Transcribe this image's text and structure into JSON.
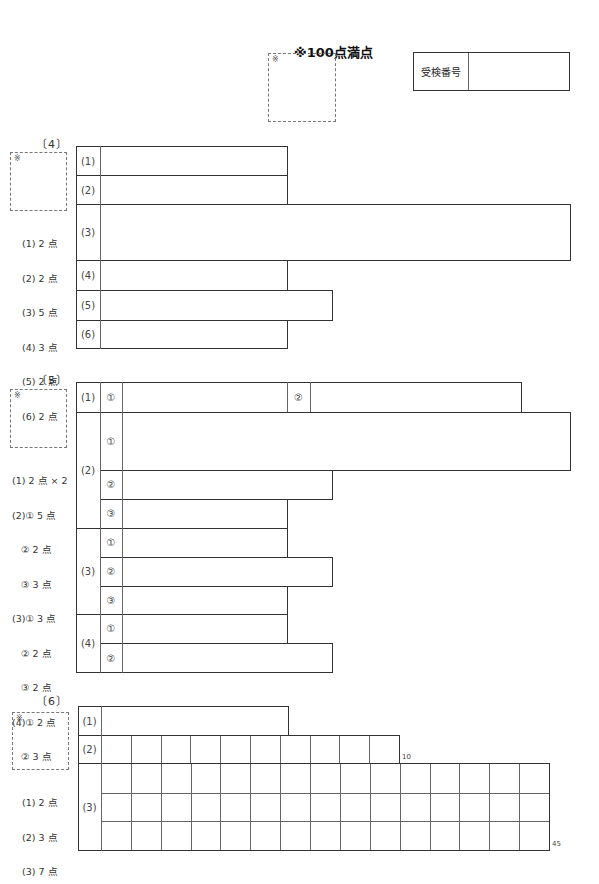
{
  "header": {
    "total_title": "※100点満点",
    "total_box_mark": "※",
    "exam_number_label": "受検番号",
    "exam_number_value": ""
  },
  "section4": {
    "label": "〔4〕",
    "box_mark": "※",
    "points": [
      "(1) 2 点",
      "(2) 2 点",
      "(3) 5 点",
      "(4) 3 点",
      "(5) 2 点",
      "(6) 2 点"
    ],
    "rows": [
      {
        "label": "(1)",
        "answer": ""
      },
      {
        "label": "(2)",
        "answer": ""
      },
      {
        "label": "(3)",
        "answer": ""
      },
      {
        "label": "(4)",
        "answer": ""
      },
      {
        "label": "(5)",
        "answer": ""
      },
      {
        "label": "(6)",
        "answer": ""
      }
    ]
  },
  "section5": {
    "label": "〔5〕",
    "box_mark": "※",
    "points": [
      "(1) 2 点 × 2",
      "(2)① 5 点",
      "   ② 2 点",
      "   ③ 3 点",
      "(3)① 3 点",
      "   ② 2 点",
      "   ③ 2 点",
      "(4)① 2 点",
      "   ② 3 点"
    ],
    "q1": {
      "label": "(1)",
      "sub1": "①",
      "sub2": "②"
    },
    "q2": {
      "label": "(2)",
      "subs": [
        "①",
        "②",
        "③"
      ]
    },
    "q3": {
      "label": "(3)",
      "subs": [
        "①",
        "②",
        "③"
      ]
    },
    "q4": {
      "label": "(4)",
      "subs": [
        "①",
        "②"
      ]
    }
  },
  "section6": {
    "label": "〔6〕",
    "box_mark": "※",
    "points": [
      "(1) 2 点",
      "(2) 3 点",
      "(3) 7 点"
    ],
    "q1": {
      "label": "(1)"
    },
    "q2": {
      "label": "(2)",
      "cells": 10,
      "count_label": "10"
    },
    "q3": {
      "label": "(3)",
      "cols": 15,
      "rows": 3,
      "count_label": "45"
    }
  }
}
